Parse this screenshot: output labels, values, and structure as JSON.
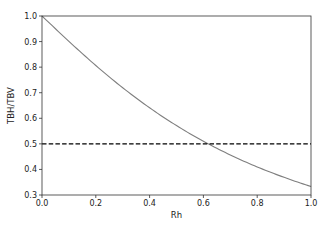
{
  "chart_data": {
    "type": "line",
    "title": "",
    "xlabel": "Rh",
    "ylabel": "TBH/TBV",
    "xlim": [
      0.0,
      1.0
    ],
    "ylim": [
      0.3,
      1.0
    ],
    "xticks": [
      "0.0",
      "0.2",
      "0.4",
      "0.6",
      "0.8",
      "1.0"
    ],
    "yticks": [
      "0.3",
      "0.4",
      "0.5",
      "0.6",
      "0.7",
      "0.8",
      "0.9",
      "1.0"
    ],
    "grid": false,
    "legend": null,
    "series": [
      {
        "name": "TBH/TBV vs Rh",
        "style": "solid",
        "color": "#7f7f7f",
        "x": [
          0.0,
          0.1,
          0.2,
          0.3,
          0.4,
          0.5,
          0.6,
          0.618,
          0.7,
          0.8,
          0.9,
          1.0
        ],
        "y": [
          1.0,
          0.901,
          0.806,
          0.719,
          0.641,
          0.571,
          0.51,
          0.5,
          0.457,
          0.41,
          0.369,
          0.333
        ]
      },
      {
        "name": "threshold",
        "style": "dashed",
        "color": "#000000",
        "x": [
          0.0,
          1.0
        ],
        "y": [
          0.5,
          0.5
        ]
      }
    ]
  }
}
